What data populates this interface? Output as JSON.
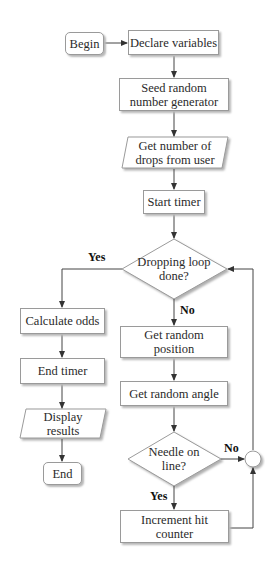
{
  "flowchart": {
    "nodes": {
      "begin": "Begin",
      "declare": "Declare variables",
      "seed_1": "Seed random",
      "seed_2": "number generator",
      "get_drops_1": "Get number of",
      "get_drops_2": "drops from user",
      "start_timer": "Start timer",
      "loop_done_1": "Dropping loop",
      "loop_done_2": "done?",
      "calc_odds": "Calculate odds",
      "end_timer": "End timer",
      "display_1": "Display",
      "display_2": "results",
      "end": "End",
      "rand_pos_1": "Get random",
      "rand_pos_2": "position",
      "rand_angle": "Get random angle",
      "needle_1": "Needle on",
      "needle_2": "line?",
      "increment_1": "Increment hit",
      "increment_2": "counter"
    },
    "labels": {
      "loop_yes": "Yes",
      "loop_no": "No",
      "needle_no": "No",
      "needle_yes": "Yes"
    }
  }
}
